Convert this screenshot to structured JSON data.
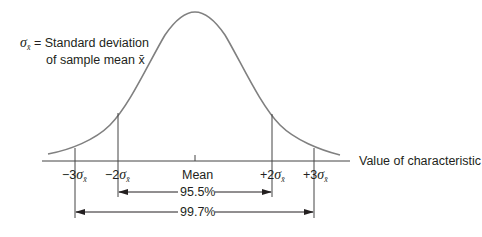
{
  "diagram": {
    "type": "normal-distribution",
    "legend": {
      "symbol": "σ",
      "subscript": "x̄",
      "line1": "= Standard deviation",
      "line2": "of sample mean x̄"
    },
    "axis_label": "Value of characteristic",
    "ticks": [
      {
        "prefix": "−3",
        "symbol": "σ",
        "sub": "x̄"
      },
      {
        "prefix": "−2",
        "symbol": "σ",
        "sub": "x̄"
      },
      {
        "label": "Mean"
      },
      {
        "prefix": "+2",
        "symbol": "σ",
        "sub": "x̄"
      },
      {
        "prefix": "+3",
        "symbol": "σ",
        "sub": "x̄"
      }
    ],
    "ranges": [
      {
        "label": "95.5%",
        "from": "−2σ",
        "to": "+2σ"
      },
      {
        "label": "99.7%",
        "from": "−3σ",
        "to": "+3σ"
      }
    ],
    "colors": {
      "curve": "#808080",
      "lines": "#555555",
      "text": "#231f20"
    }
  }
}
